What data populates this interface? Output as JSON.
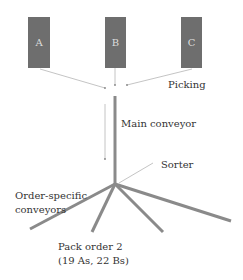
{
  "colors": {
    "box_fill": "#6e6e6e",
    "conveyor": "#8a8a8a",
    "arrow": "#b5b5b5",
    "text": "#333333",
    "box_text": "#dddddd"
  },
  "pick_zones": [
    {
      "label": "A"
    },
    {
      "label": "B"
    },
    {
      "label": "C"
    }
  ],
  "labels": {
    "picking": "Picking",
    "main_conveyor": "Main conveyor",
    "sorter": "Sorter",
    "order_specific_line1": "Order-specific",
    "order_specific_line2": "conveyors",
    "pack_order_line1": "Pack order 2",
    "pack_order_line2": "(19 As, 22 Bs)"
  }
}
